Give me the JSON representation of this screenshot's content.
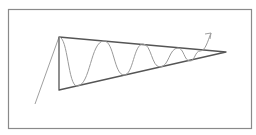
{
  "diagram": {
    "type": "symmetrical-triangle-chart-pattern",
    "frame": {
      "x": 8,
      "y": 9,
      "width": 243,
      "height": 119,
      "color": "#8a8a8a"
    },
    "colors": {
      "triangle": "#555555",
      "wave": "#9a9a9a",
      "trend": "#a0a0a0",
      "arrow": "#a0a0a0",
      "background": "#ffffff"
    },
    "trend_in": {
      "from": [
        35,
        104
      ],
      "to": [
        59,
        37
      ]
    },
    "triangle": {
      "apex_top": [
        59,
        37
      ],
      "apex_bottom": [
        59,
        90
      ],
      "convergence": [
        226,
        52
      ]
    },
    "wave_points": [
      [
        59,
        37
      ],
      [
        77,
        86
      ],
      [
        104,
        41
      ],
      [
        124,
        75
      ],
      [
        143,
        44
      ],
      [
        160,
        67
      ],
      [
        178,
        48
      ],
      [
        190,
        61
      ],
      [
        200,
        51
      ],
      [
        211,
        33
      ]
    ],
    "breakout_arrow": {
      "tip": [
        211,
        33
      ],
      "direction": "up-right"
    }
  }
}
